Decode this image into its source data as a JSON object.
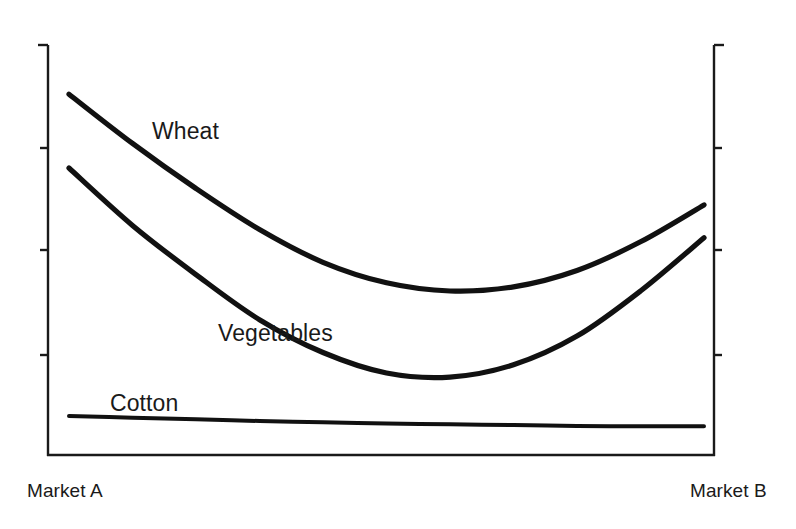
{
  "chart_data": {
    "type": "line",
    "title": "",
    "subtitle": "",
    "xlabel": "",
    "ylabel": "",
    "grid": false,
    "legend_position": "inline-annotations",
    "axis": {
      "left_axis_visible": true,
      "right_axis_visible": true,
      "bottom_axis_visible": true,
      "top_axis_visible": false,
      "tick_labels_x": [
        "Market A",
        "Market B"
      ],
      "tick_labels_y": [],
      "y_tick_count": 5,
      "x_range_labels": [
        "Market A",
        "Market B"
      ],
      "xlim": [
        0,
        100
      ],
      "ylim": [
        0,
        100
      ]
    },
    "x": [
      0,
      10,
      20,
      30,
      40,
      50,
      60,
      70,
      80,
      90,
      100
    ],
    "series": [
      {
        "name": "Wheat",
        "label": "Wheat",
        "color": "#111111",
        "values": [
          88,
          76,
          65,
          55,
          47,
          42,
          40,
          41,
          45,
          52,
          61
        ]
      },
      {
        "name": "Vegetables",
        "label": "Vegetables",
        "color": "#111111",
        "values": [
          70,
          56,
          44,
          33,
          25,
          20,
          19,
          22,
          29,
          40,
          53
        ]
      },
      {
        "name": "Cotton",
        "label": "Cotton",
        "color": "#111111",
        "values": [
          9.5,
          9.1,
          8.7,
          8.3,
          8.0,
          7.7,
          7.5,
          7.3,
          7.1,
          7.0,
          7.0
        ]
      }
    ],
    "annotations": [
      {
        "text": "Wheat",
        "x_px": 152,
        "y_px": 118
      },
      {
        "text": "Vegetables",
        "x_px": 218,
        "y_px": 320
      },
      {
        "text": "Cotton",
        "x_px": 110,
        "y_px": 390
      }
    ]
  },
  "labels": {
    "wheat": "Wheat",
    "vegetables": "Vegetables",
    "cotton": "Cotton",
    "market_a": "Market A",
    "market_b": "Market B"
  },
  "colors": {
    "line": "#111111",
    "axis": "#1a1a1a",
    "background": "#ffffff",
    "text": "#1a1a1a"
  }
}
